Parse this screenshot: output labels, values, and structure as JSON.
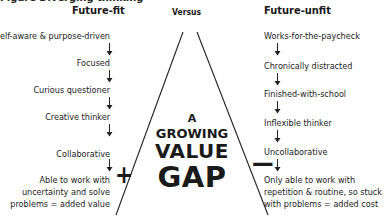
{
  "caption": "Figure  Diverging thinking",
  "headers": {
    "left": "Future-fit",
    "center": "Versus",
    "right": "Future-unfit"
  },
  "left_items": [
    "Self-aware & purpose-driven",
    "Focused",
    "Curious questioner",
    "Creative thinker",
    "Collaborative",
    "Able to work with",
    "uncertainty and solve",
    "problems = added value"
  ],
  "right_items": [
    "Works-for-the-paycheck",
    "Chronically distracted",
    "Finished-with-school",
    "Inflexible thinker",
    "Uncollaborative",
    "Only able to work with",
    "repetition & routine, so stuck",
    "with problems = added cost"
  ],
  "center": {
    "line1": "A",
    "line2": "GROWING",
    "line3": "VALUE",
    "line4": "GAP",
    "plus": "+",
    "minus": "—"
  },
  "colors": {
    "text": "#1a1a1a",
    "background": "#ffffff",
    "line": "#222222"
  }
}
